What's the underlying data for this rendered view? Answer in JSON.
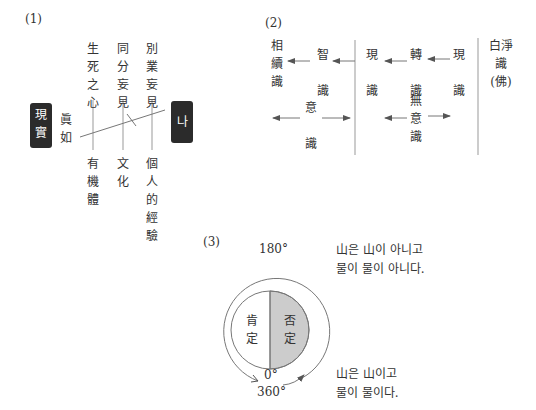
{
  "diagram1": {
    "label": "(1)",
    "left_box": "現實",
    "right_box": "나",
    "left_text": "眞如",
    "top": [
      "生死之心",
      "同分妄見",
      "別業妄見"
    ],
    "bottom": [
      "有機體",
      "文化",
      "個人的經驗"
    ]
  },
  "diagram2": {
    "label": "(2)",
    "col1": {
      "left": "相續識",
      "right": "智識",
      "mid": "意識"
    },
    "col2": {
      "left": "現識",
      "center": "轉識",
      "right": "現識",
      "mid": "無意識"
    },
    "col3": "白淨識(佛)"
  },
  "diagram3": {
    "label": "(3)",
    "top_angle": "180°",
    "zero": "0°",
    "full": "360°",
    "left_half": "肯定",
    "right_half": "否定",
    "top_text": [
      "山은 山이 아니고",
      "물이 물이 아니다."
    ],
    "bottom_text": [
      "山은 山이고",
      "물이 물이다."
    ]
  }
}
